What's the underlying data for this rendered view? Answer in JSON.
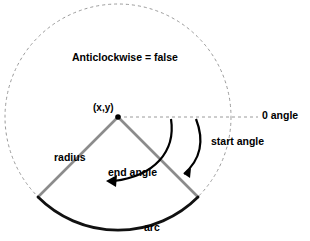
{
  "diagram": {
    "type": "arc-geometry-illustration",
    "colors": {
      "background": "#ffffff",
      "dashed_circle": "#9a9a9a",
      "radius_line": "#8c8c8c",
      "arc_stroke": "#000000",
      "angle_arrow": "#000000",
      "text": "#000000"
    },
    "geometry": {
      "center_x": 118,
      "center_y": 117,
      "circle_radius": 113,
      "wedge_radius": 113,
      "start_angle_deg": 45,
      "end_angle_deg": 135,
      "zero_angle_line_end_x": 258,
      "anticlockwise": false
    },
    "labels": {
      "anticlockwise": "Anticlockwise = false",
      "center_point": "(x,y)",
      "zero_angle": "0 angle",
      "start_angle": "start angle",
      "end_angle": "end angle",
      "radius": "radius",
      "arc": "arc"
    }
  }
}
